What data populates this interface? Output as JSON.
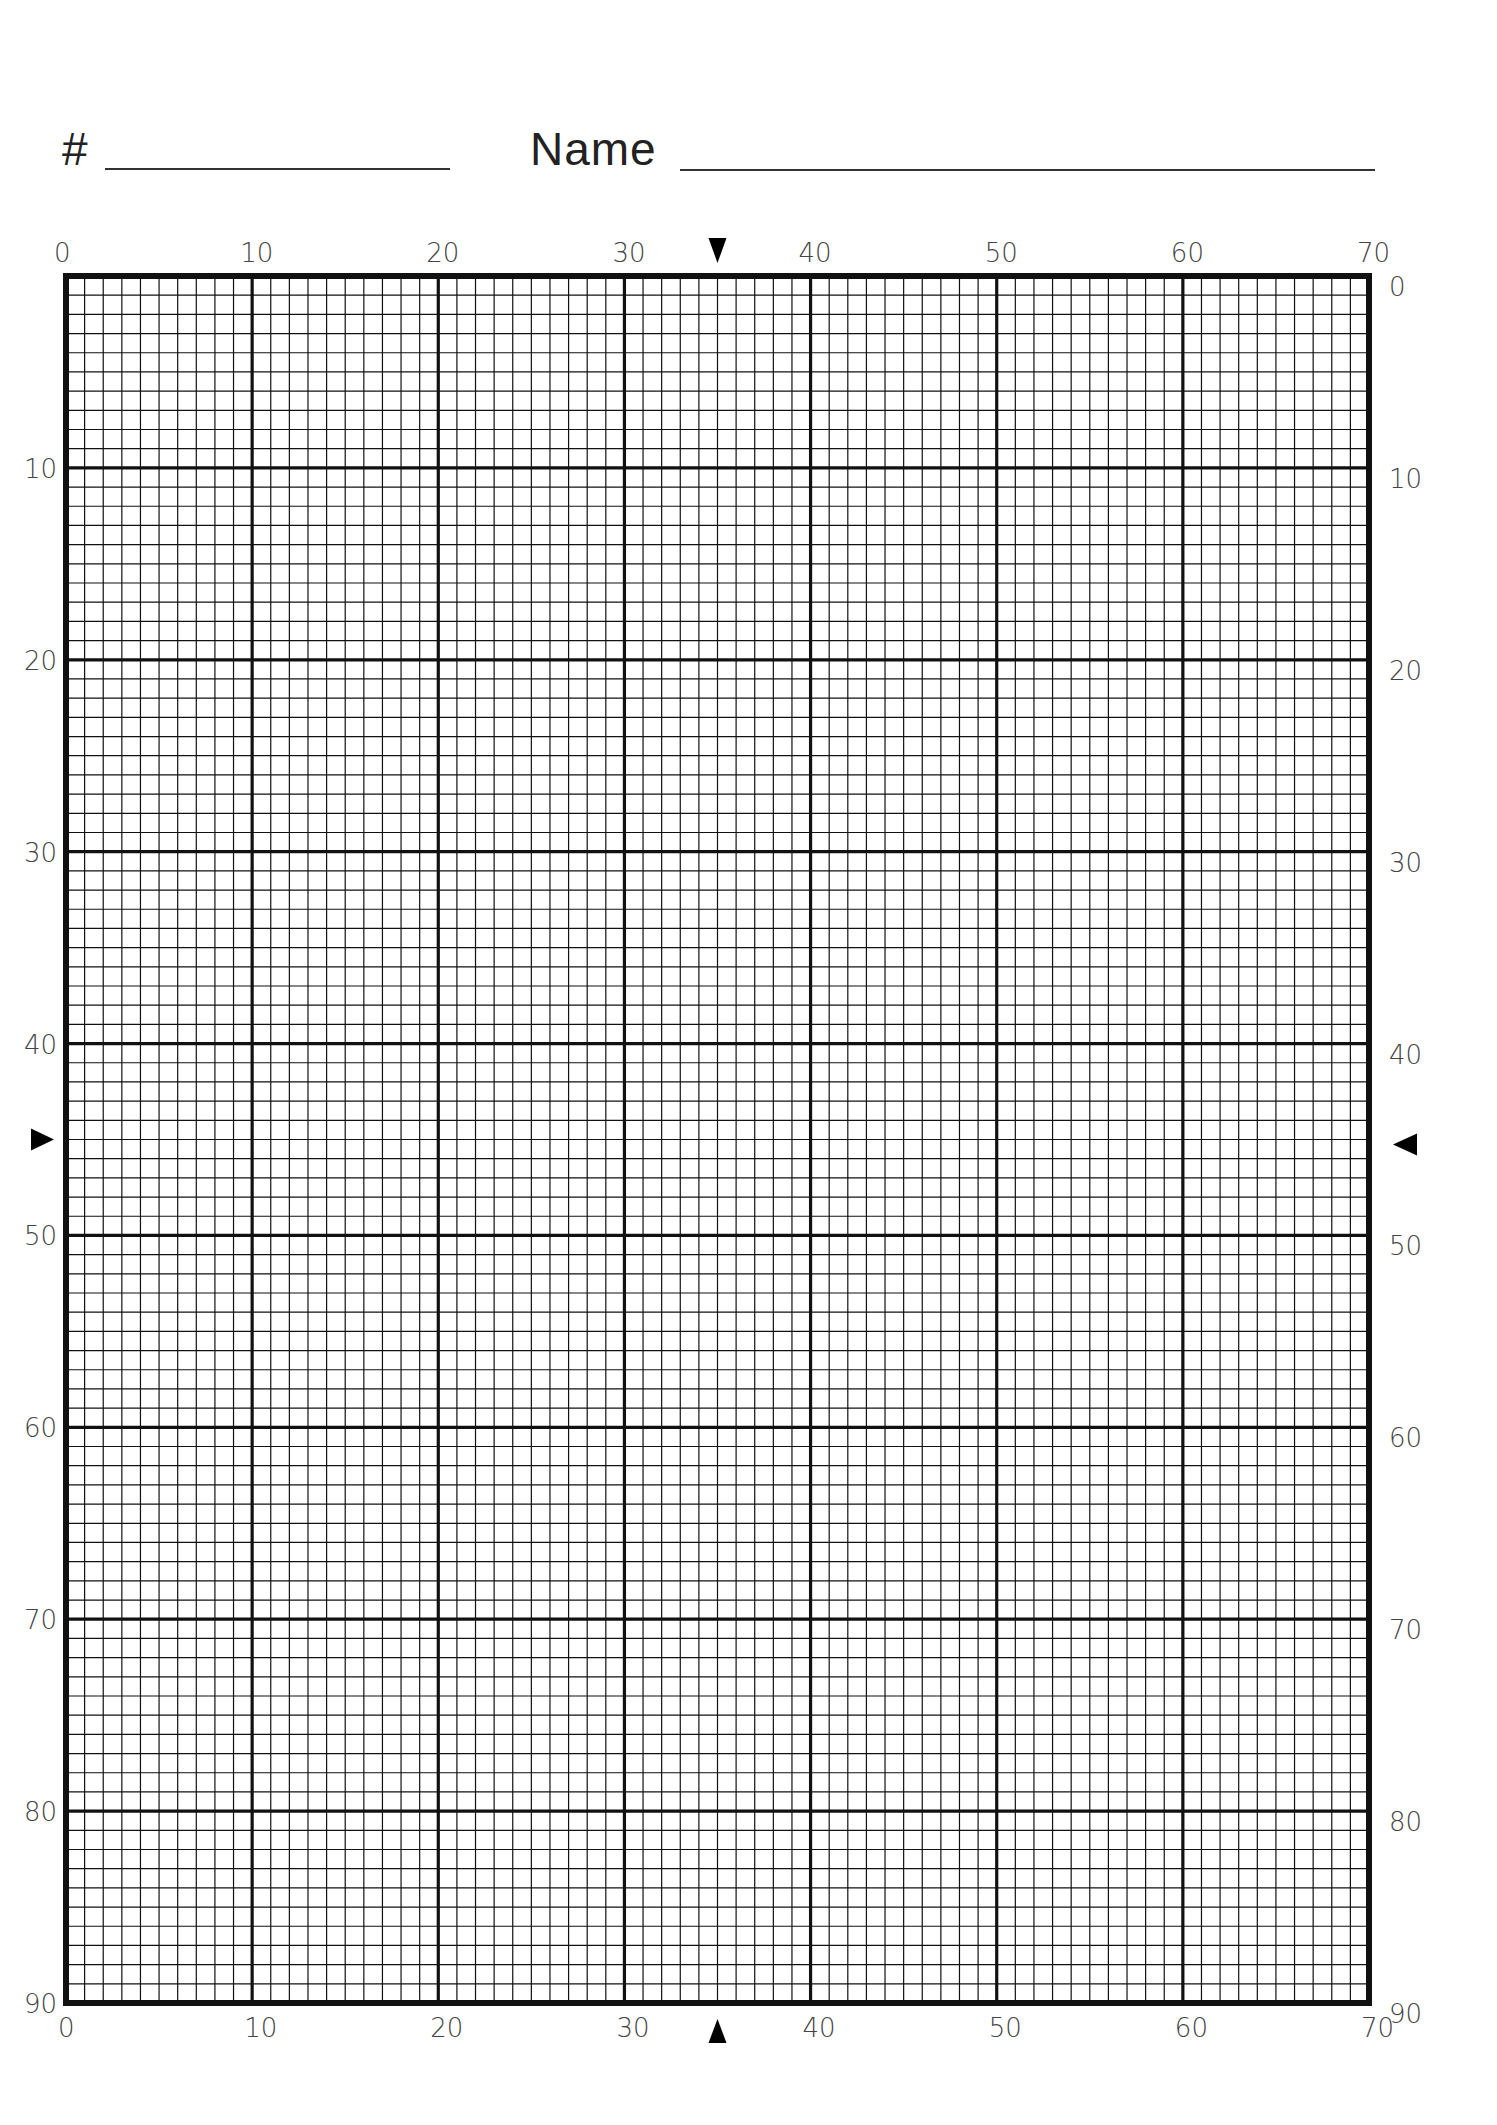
{
  "header": {
    "number_label": "#",
    "number_value": "",
    "name_label": "Name",
    "name_value": ""
  },
  "grid": {
    "columns": 70,
    "rows": 90,
    "major_every": 10,
    "left": 66,
    "top": 276,
    "right": 1369,
    "bottom": 2003,
    "line_color": "#111111",
    "minor_width": 1.2,
    "major_width": 3.2,
    "border_width": 6,
    "x_tick_labels": [
      "0",
      "10",
      "20",
      "30",
      "40",
      "50",
      "60",
      "70"
    ],
    "y_tick_labels": [
      "0",
      "10",
      "20",
      "30",
      "40",
      "50",
      "60",
      "70",
      "80",
      "90"
    ]
  },
  "center_markers": {
    "column": 35,
    "row": 45,
    "top": "▼",
    "bottom": "▲",
    "left": "►",
    "right": "◄"
  }
}
